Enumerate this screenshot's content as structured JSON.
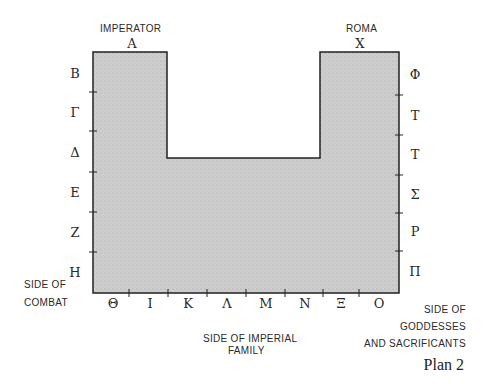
{
  "plan": {
    "caption": "Plan 2",
    "fill_color": "#c8c8c8",
    "stroke_color": "#222222",
    "top_labels": {
      "left": {
        "title": "IMPERATOR",
        "letter": "A"
      },
      "right": {
        "title": "ROMA",
        "letter": "X"
      }
    },
    "left_letters": [
      "B",
      "Γ",
      "Δ",
      "E",
      "Z",
      "H"
    ],
    "right_letters": [
      "Φ",
      "T",
      "T",
      "Σ",
      "P",
      "Π"
    ],
    "bottom_letters": [
      "Θ",
      "I",
      "K",
      "Λ",
      "M",
      "N",
      "Ξ",
      "O"
    ],
    "side_labels": {
      "combat_1": "SIDE OF",
      "combat_2": "COMBAT",
      "imperial_1": "SIDE OF IMPERIAL",
      "imperial_2": "FAMILY",
      "goddesses_1": "SIDE OF",
      "goddesses_2": "GODDESSES",
      "goddesses_3": "AND SACRIFICANTS"
    }
  }
}
